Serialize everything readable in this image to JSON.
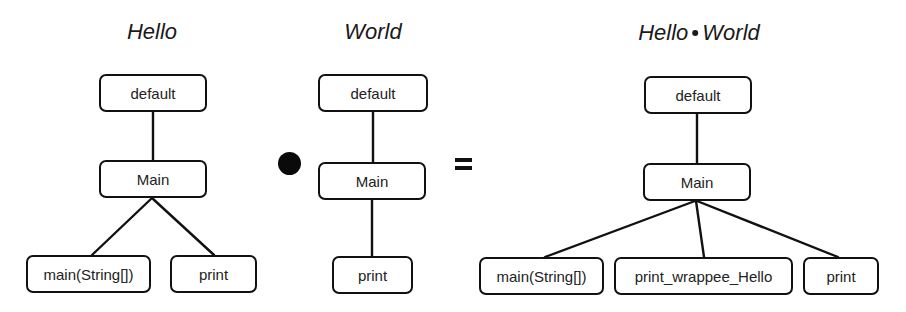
{
  "diagram": {
    "operator_symbol": "•",
    "equals_symbol": "=",
    "trees": {
      "hello": {
        "title": "Hello",
        "nodes": {
          "root": "default",
          "class": "Main",
          "children": [
            "main(String[])",
            "print"
          ]
        }
      },
      "world": {
        "title": "World",
        "nodes": {
          "root": "default",
          "class": "Main",
          "children": [
            "print"
          ]
        }
      },
      "result": {
        "title_left": "Hello",
        "title_op": "•",
        "title_right": "World",
        "nodes": {
          "root": "default",
          "class": "Main",
          "children": [
            "main(String[])",
            "print_wrappee_Hello",
            "print"
          ]
        }
      }
    },
    "colors": {
      "stroke": "#111111",
      "text": "#222222",
      "background": "#ffffff"
    }
  }
}
